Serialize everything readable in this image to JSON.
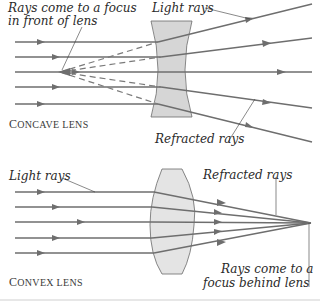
{
  "concave": {
    "caption_first": "C",
    "caption_rest": "ONCAVE LENS",
    "label_focus_line1": "Rays come to a focus",
    "label_focus_line2": "in front of lens",
    "label_light_rays": "Light rays",
    "label_refracted_rays": "Refracted rays",
    "lens_fill": "#d6d6d6"
  },
  "convex": {
    "caption_first": "C",
    "caption_rest": "ONVEX LENS",
    "label_light_rays": "Light rays",
    "label_refracted_rays": "Refracted rays",
    "label_focus_line1": "Rays come to a",
    "label_focus_line2": "focus behind lens",
    "lens_fill": "#e4e4e4"
  },
  "colors": {
    "ray": "#6e6e6e",
    "lens_stroke": "#6a6a6a",
    "text": "#2a2a2a",
    "bottom_rule": "#cfcfcf"
  }
}
